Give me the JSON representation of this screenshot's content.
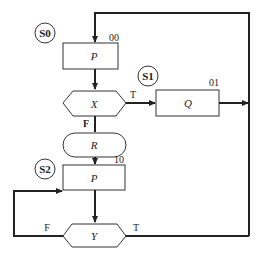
{
  "diagram": {
    "type": "ASM flowchart",
    "states": [
      {
        "id": "S0",
        "label": "S0",
        "code": "00",
        "output": "P"
      },
      {
        "id": "S1",
        "label": "S1",
        "code": "01",
        "output": "Q"
      },
      {
        "id": "S2",
        "label": "S2",
        "code": "10",
        "output": "P"
      }
    ],
    "decisions": [
      {
        "id": "X",
        "label": "X",
        "true_label": "T",
        "false_label": "F"
      },
      {
        "id": "Y",
        "label": "Y",
        "true_label": "T",
        "false_label": "F"
      }
    ],
    "conditional_outputs": [
      {
        "id": "R",
        "label": "R"
      }
    ],
    "colors": {
      "line": "#222222",
      "background": "#ffffff"
    }
  }
}
